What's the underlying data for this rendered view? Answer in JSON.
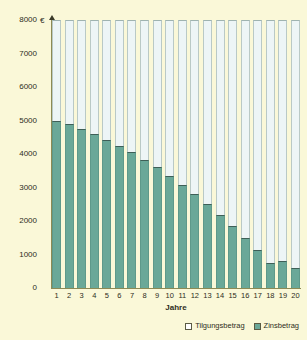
{
  "chart_data": {
    "type": "bar",
    "subtype": "stacked-bar",
    "title": "",
    "xlabel": "Jahre",
    "ylabel": "",
    "y_unit": "€",
    "ylim": [
      0,
      8000
    ],
    "y_ticks": [
      0,
      1000,
      2000,
      3000,
      4000,
      5000,
      6000,
      7000,
      8000
    ],
    "y_tick_labels": [
      "0",
      "1000",
      "2000",
      "3000",
      "4000",
      "5000",
      "6000",
      "7000",
      "8000"
    ],
    "grid": false,
    "legend_position": "bottom-right",
    "categories": [
      "1",
      "2",
      "3",
      "4",
      "5",
      "6",
      "7",
      "8",
      "9",
      "10",
      "11",
      "12",
      "13",
      "14",
      "15",
      "16",
      "17",
      "18",
      "19",
      "20"
    ],
    "total_per_bar": 8000,
    "series": [
      {
        "name": "Zinsbetrag",
        "color": "#6aa898",
        "values": [
          5000,
          4900,
          4750,
          4600,
          4430,
          4250,
          4050,
          3830,
          3600,
          3350,
          3080,
          2800,
          2500,
          2180,
          1850,
          1500,
          1130,
          740,
          820,
          600
        ]
      },
      {
        "name": "Tilgungsbetrag",
        "color": "#edf5f6",
        "values": [
          3000,
          3100,
          3250,
          3400,
          3570,
          3750,
          3950,
          4170,
          4400,
          4650,
          4920,
          5200,
          5500,
          5820,
          6150,
          6500,
          6870,
          7260,
          7180,
          7400
        ]
      }
    ]
  },
  "axis": {
    "euro_symbol": "€"
  },
  "legend": {
    "entries": [
      {
        "label": "Tilgungsbetrag",
        "swatch": "principal"
      },
      {
        "label": "Zinsbetrag",
        "swatch": "interest"
      }
    ]
  },
  "colors": {
    "background": "#faf8d8",
    "interest": "#6aa898",
    "principal": "#edf5f6",
    "axis": "#8d8a55",
    "text": "#2d2d22"
  }
}
